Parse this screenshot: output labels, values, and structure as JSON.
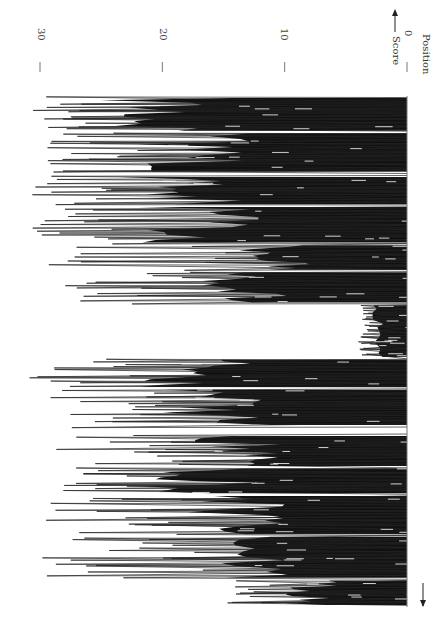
{
  "chart_data": {
    "type": "area",
    "title": "",
    "orientation": "rotated-90-clockwise",
    "xlabel": "Position",
    "ylabel": "Score",
    "ylim": [
      0,
      32
    ],
    "yticks": [
      0,
      10,
      20,
      30
    ],
    "grid": false,
    "legend": null,
    "regions": [
      {
        "position_start": 0,
        "position_end": 12,
        "typical_max": 26,
        "peak": 31
      },
      {
        "position_start": 13,
        "position_end": 27,
        "typical_max": 22,
        "peak": 30
      },
      {
        "position_start": 29,
        "position_end": 39,
        "typical_max": 24,
        "peak": 31
      },
      {
        "position_start": 40,
        "position_end": 53,
        "typical_max": 22,
        "peak": 31
      },
      {
        "position_start": 54,
        "position_end": 63,
        "typical_max": 14,
        "peak": 30
      },
      {
        "position_start": 64,
        "position_end": 75,
        "typical_max": 17,
        "peak": 28
      },
      {
        "position_start": 76,
        "position_end": 95,
        "typical_max": 3,
        "peak": 4
      },
      {
        "position_start": 96,
        "position_end": 106,
        "typical_max": 22,
        "peak": 31
      },
      {
        "position_start": 107,
        "position_end": 120,
        "typical_max": 20,
        "peak": 30
      },
      {
        "position_start": 124,
        "position_end": 135,
        "typical_max": 18,
        "peak": 29
      },
      {
        "position_start": 136,
        "position_end": 145,
        "typical_max": 22,
        "peak": 31
      },
      {
        "position_start": 146,
        "position_end": 160,
        "typical_max": 18,
        "peak": 30
      },
      {
        "position_start": 161,
        "position_end": 176,
        "typical_max": 16,
        "peak": 30
      },
      {
        "position_start": 177,
        "position_end": 186,
        "typical_max": 10,
        "peak": 18
      }
    ]
  },
  "labels": {
    "score": "Score",
    "position": "Position",
    "tick_0": "0",
    "tick_10": "10",
    "tick_20": "20",
    "tick_30": "30"
  }
}
